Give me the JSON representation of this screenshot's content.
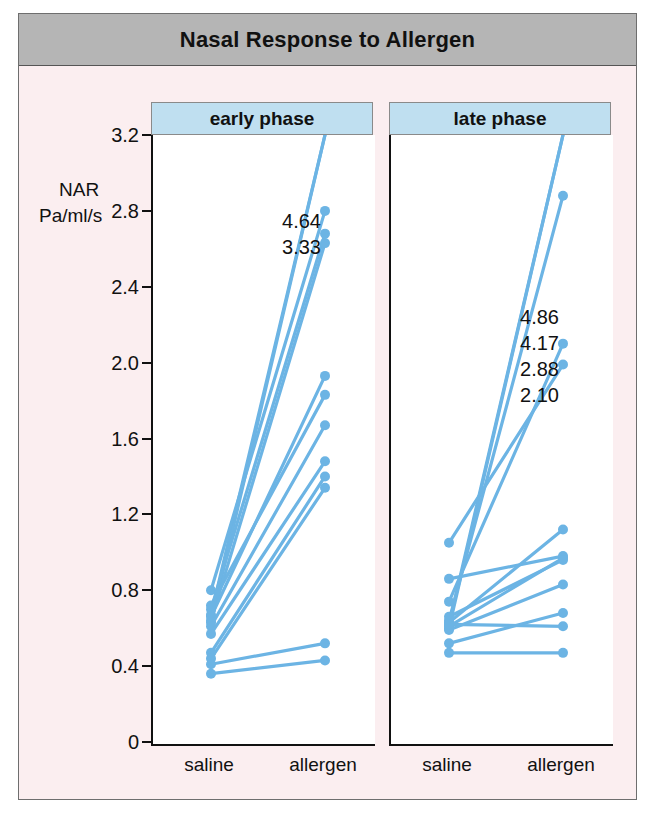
{
  "figure": {
    "title": "Nasal Response to Allergen",
    "background_color": "#fbeef0",
    "title_band_color": "#b5b5b5",
    "panel_header_color": "#bfdff0",
    "series_color": "#6cb4e4"
  },
  "axis": {
    "y_label_line1": "NAR",
    "y_label_line2": "Pa/ml/s",
    "y_ticks": [
      "3.2",
      "2.8",
      "2.4",
      "2.0",
      "1.6",
      "1.2",
      "0.8",
      "0.4",
      "0"
    ],
    "x_ticks": [
      "saline",
      "allergen"
    ]
  },
  "chart_data": {
    "type": "line",
    "title": "Nasal Response to Allergen",
    "xlabel": "",
    "ylabel": "NAR Pa/ml/s",
    "ylim": [
      0,
      3.2
    ],
    "ytick_values": [
      3.2,
      2.8,
      2.4,
      2.0,
      1.6,
      1.2,
      0.8,
      0.4,
      0
    ],
    "grid": false,
    "legend": "none",
    "x": [
      "saline",
      "allergen"
    ],
    "panels": [
      {
        "name": "early phase",
        "offscale_labels": [
          "4.64",
          "3.33"
        ],
        "offscale_note": "values above axis maximum, plotted at top",
        "subjects": [
          {
            "saline": 0.67,
            "allergen": 4.64,
            "clipped": true
          },
          {
            "saline": 0.63,
            "allergen": 3.33,
            "clipped": true
          },
          {
            "saline": 0.8,
            "allergen": 2.8
          },
          {
            "saline": 0.7,
            "allergen": 2.68
          },
          {
            "saline": 0.64,
            "allergen": 2.63
          },
          {
            "saline": 0.66,
            "allergen": 1.93
          },
          {
            "saline": 0.72,
            "allergen": 1.83
          },
          {
            "saline": 0.61,
            "allergen": 1.67
          },
          {
            "saline": 0.57,
            "allergen": 1.48
          },
          {
            "saline": 0.47,
            "allergen": 1.4
          },
          {
            "saline": 0.44,
            "allergen": 1.34
          },
          {
            "saline": 0.41,
            "allergen": 0.52
          },
          {
            "saline": 0.36,
            "allergen": 0.43
          }
        ]
      },
      {
        "name": "late phase",
        "offscale_labels": [
          "4.86",
          "4.17",
          "2.88",
          "2.10"
        ],
        "offscale_note": "values above axis maximum, plotted at top",
        "subjects": [
          {
            "saline": 0.62,
            "allergen": 4.86,
            "clipped": true
          },
          {
            "saline": 0.6,
            "allergen": 4.17,
            "clipped": true
          },
          {
            "saline": 0.64,
            "allergen": 2.88,
            "clipped": true
          },
          {
            "saline": 0.74,
            "allergen": 2.1,
            "clipped": true
          },
          {
            "saline": 1.05,
            "allergen": 1.99
          },
          {
            "saline": 0.63,
            "allergen": 1.12
          },
          {
            "saline": 0.86,
            "allergen": 0.98
          },
          {
            "saline": 0.61,
            "allergen": 0.97
          },
          {
            "saline": 0.66,
            "allergen": 0.96
          },
          {
            "saline": 0.59,
            "allergen": 0.83
          },
          {
            "saline": 0.52,
            "allergen": 0.68
          },
          {
            "saline": 0.62,
            "allergen": 0.61
          },
          {
            "saline": 0.47,
            "allergen": 0.47
          }
        ]
      }
    ]
  }
}
